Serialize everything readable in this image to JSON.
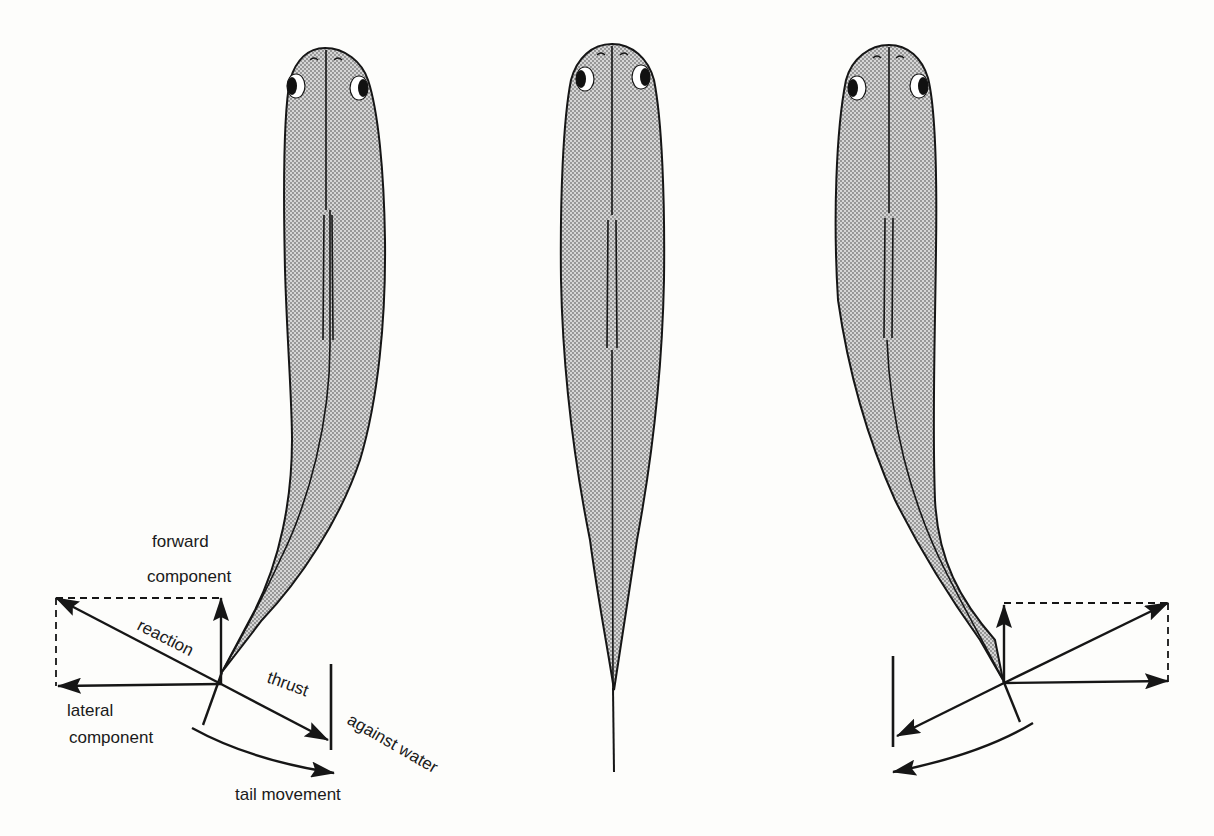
{
  "figure": {
    "panels": [
      {
        "id": "left",
        "description": "tail bent to the left, pushing against water",
        "labels": {
          "forward_component_line1": "forward",
          "forward_component_line2": "component",
          "reaction": "reaction",
          "thrust": "thrust",
          "against_water": "against water",
          "lateral_component_line1": "lateral",
          "lateral_component_line2": "component",
          "tail_movement": "tail movement"
        }
      },
      {
        "id": "center",
        "description": "fish straight, tail in line with body",
        "labels": {}
      },
      {
        "id": "right",
        "description": "tail bent to the right, mirror of left panel without labels",
        "labels": {}
      }
    ],
    "colors": {
      "ink": "#161616",
      "body_fill": "#c9c9c9",
      "background": "#fdfdfb"
    }
  }
}
